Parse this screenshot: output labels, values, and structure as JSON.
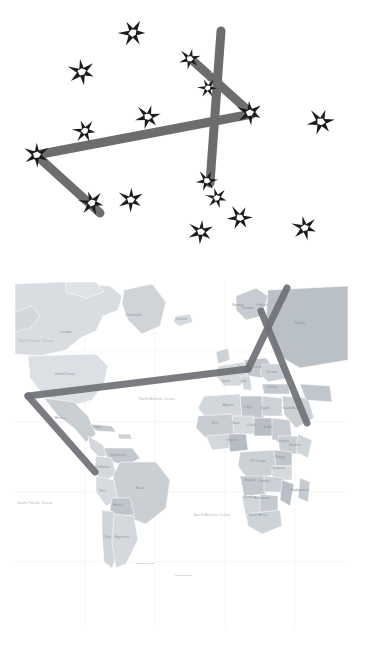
{
  "figure": {
    "panels": [
      {
        "id": "constellation",
        "name": "Hand-drawn constellation sketch"
      },
      {
        "id": "worldmap",
        "name": "World map with constellation overlay"
      }
    ]
  },
  "colors": {
    "background": "#ffffff",
    "line_stroke": "#6d6d6d",
    "line_stroke_map": "#6f7276",
    "star_fill": "#1c1c1c",
    "map_ocean": "#ffffff",
    "map_land_light": "#dfe3e6",
    "map_land_mid": "#c8cdd2",
    "map_land_dark": "#b0b7bd",
    "map_border": "#ffffff",
    "graticule": "#eceef0",
    "label_text": "#8d9398"
  },
  "constellation": {
    "name": "constellation-figure",
    "line_width": 9,
    "stroke_linecap": "round",
    "nodes": [
      {
        "id": "n-apex-top",
        "label": "apex-top",
        "x": 221,
        "y": 31
      },
      {
        "id": "n-vertex-mid",
        "label": "mid-junction",
        "x": 155,
        "y": 118
      },
      {
        "id": "n-right-end",
        "label": "right-terminus",
        "x": 252,
        "y": 114
      },
      {
        "id": "n-left-end",
        "label": "left-terminus",
        "x": 36,
        "y": 155
      },
      {
        "id": "n-bottom-left",
        "label": "bottom-left-tip",
        "x": 100,
        "y": 213
      },
      {
        "id": "n-bottom-right",
        "label": "bottom-right-tip",
        "x": 210,
        "y": 183
      },
      {
        "id": "n-elbow",
        "label": "upper-elbow",
        "x": 192,
        "y": 60
      }
    ],
    "segments": [
      {
        "id": "s1",
        "from": "n-apex-top",
        "to": "n-bottom-right",
        "label": "apex-to-bottom-right"
      },
      {
        "id": "s2",
        "from": "n-elbow",
        "to": "n-right-end",
        "label": "elbow-to-right"
      },
      {
        "id": "s3",
        "from": "n-left-end",
        "to": "n-right-end",
        "label": "long-horizontal-spine"
      },
      {
        "id": "s4",
        "from": "n-left-end",
        "to": "n-bottom-left",
        "label": "left-to-bottom-left"
      }
    ],
    "stars": [
      {
        "id": "st-1",
        "label": "star-top-left-outer",
        "x": 133,
        "y": 33,
        "r": 14,
        "on_line": false
      },
      {
        "id": "st-2",
        "label": "star-upper-left",
        "x": 82,
        "y": 72,
        "r": 14,
        "on_line": false
      },
      {
        "id": "st-3",
        "label": "star-apex",
        "x": 190,
        "y": 59,
        "r": 11,
        "on_line": true
      },
      {
        "id": "st-4",
        "label": "star-inner-triangle",
        "x": 208,
        "y": 88,
        "r": 10,
        "on_line": true
      },
      {
        "id": "st-5",
        "label": "star-right-terminus",
        "x": 250,
        "y": 113,
        "r": 13,
        "on_line": true
      },
      {
        "id": "st-6",
        "label": "star-mid-junction",
        "x": 148,
        "y": 117,
        "r": 13,
        "on_line": true
      },
      {
        "id": "st-7",
        "label": "star-left-spine",
        "x": 85,
        "y": 131,
        "r": 12,
        "on_line": true
      },
      {
        "id": "st-8",
        "label": "star-left-terminus",
        "x": 37,
        "y": 155,
        "r": 13,
        "on_line": true
      },
      {
        "id": "st-9",
        "label": "star-far-right",
        "x": 321,
        "y": 122,
        "r": 14,
        "on_line": false
      },
      {
        "id": "st-10",
        "label": "star-bottom-left-tip",
        "x": 92,
        "y": 203,
        "r": 13,
        "on_line": true
      },
      {
        "id": "st-11",
        "label": "star-below-spine",
        "x": 131,
        "y": 200,
        "r": 13,
        "on_line": false
      },
      {
        "id": "st-12",
        "label": "star-bottom-right-tip",
        "x": 207,
        "y": 181,
        "r": 11,
        "on_line": true
      },
      {
        "id": "st-13",
        "label": "star-lower-mid",
        "x": 217,
        "y": 198,
        "r": 11,
        "on_line": false
      },
      {
        "id": "st-14",
        "label": "star-lower-centre",
        "x": 201,
        "y": 232,
        "r": 13,
        "on_line": false
      },
      {
        "id": "st-15",
        "label": "star-lower-right",
        "x": 240,
        "y": 218,
        "r": 13,
        "on_line": false
      },
      {
        "id": "st-16",
        "label": "star-bottom-right-outer",
        "x": 305,
        "y": 228,
        "r": 13,
        "on_line": false
      }
    ]
  },
  "worldmap": {
    "name": "world-map",
    "projection": "equirectangular",
    "visible_region": "Americas, Atlantic Ocean, Europe, Africa",
    "frame": {
      "x": 15,
      "y": 6,
      "width": 333,
      "height": 346
    },
    "overlay": {
      "line_width": 7,
      "nodes": [
        {
          "id": "m-apex-top",
          "label": "apex-top",
          "x": 287,
          "y": 12
        },
        {
          "id": "m-elbow",
          "label": "upper-elbow",
          "x": 261,
          "y": 35
        },
        {
          "id": "m-vertex",
          "label": "mid-junction",
          "x": 248,
          "y": 93
        },
        {
          "id": "m-right-end",
          "label": "right-terminus",
          "x": 307,
          "y": 147
        },
        {
          "id": "m-left-end",
          "label": "left-terminus",
          "x": 28,
          "y": 120
        },
        {
          "id": "m-bottom-left",
          "label": "bottom-left-tip",
          "x": 95,
          "y": 196
        }
      ],
      "segments": [
        {
          "id": "ms1",
          "from": "m-apex-top",
          "to": "m-vertex",
          "label": "apex-to-junction"
        },
        {
          "id": "ms2",
          "from": "m-elbow",
          "to": "m-right-end",
          "label": "elbow-to-right"
        },
        {
          "id": "ms3",
          "from": "m-left-end",
          "to": "m-vertex",
          "label": "long-transatlantic-spine"
        },
        {
          "id": "ms4",
          "from": "m-left-end",
          "to": "m-bottom-left",
          "label": "left-to-bottom-left"
        }
      ]
    },
    "labels": {
      "oceans": [
        {
          "text": "North Atlantic Ocean",
          "x": 157,
          "y": 124
        },
        {
          "text": "South Atlantic Ocean",
          "x": 212,
          "y": 240
        },
        {
          "text": "North Pacific Ocean",
          "x": 36,
          "y": 66
        },
        {
          "text": "South Pacific Ocean",
          "x": 35,
          "y": 228
        }
      ],
      "regions": [
        {
          "text": "Greenland",
          "x": 133,
          "y": 40
        },
        {
          "text": "Canada",
          "x": 66,
          "y": 57
        },
        {
          "text": "Iceland",
          "x": 181,
          "y": 44
        },
        {
          "text": "United States",
          "x": 65,
          "y": 99
        },
        {
          "text": "Mexico",
          "x": 60,
          "y": 143
        },
        {
          "text": "Cuba",
          "x": 97,
          "y": 152
        },
        {
          "text": "Venezuela",
          "x": 118,
          "y": 180
        },
        {
          "text": "Colombia",
          "x": 103,
          "y": 192
        },
        {
          "text": "Brazil",
          "x": 140,
          "y": 213
        },
        {
          "text": "Peru",
          "x": 103,
          "y": 216
        },
        {
          "text": "Bolivia",
          "x": 118,
          "y": 230
        },
        {
          "text": "Chile",
          "x": 107,
          "y": 262
        },
        {
          "text": "Argentina",
          "x": 122,
          "y": 262
        },
        {
          "text": "Norway",
          "x": 238,
          "y": 30
        },
        {
          "text": "Sweden",
          "x": 248,
          "y": 33
        },
        {
          "text": "Finland",
          "x": 262,
          "y": 30
        },
        {
          "text": "Russia",
          "x": 300,
          "y": 48
        },
        {
          "text": "Spain",
          "x": 226,
          "y": 106
        },
        {
          "text": "France",
          "x": 232,
          "y": 97
        },
        {
          "text": "Germany",
          "x": 245,
          "y": 92
        },
        {
          "text": "Poland",
          "x": 256,
          "y": 92
        },
        {
          "text": "Ukraine",
          "x": 272,
          "y": 97
        },
        {
          "text": "Turkey",
          "x": 272,
          "y": 112
        },
        {
          "text": "Italy",
          "x": 243,
          "y": 106
        },
        {
          "text": "Algeria",
          "x": 228,
          "y": 130
        },
        {
          "text": "Libya",
          "x": 248,
          "y": 132
        },
        {
          "text": "Egypt",
          "x": 265,
          "y": 133
        },
        {
          "text": "Mali",
          "x": 215,
          "y": 148
        },
        {
          "text": "Niger",
          "x": 236,
          "y": 148
        },
        {
          "text": "Chad",
          "x": 251,
          "y": 150
        },
        {
          "text": "Sudan",
          "x": 268,
          "y": 152
        },
        {
          "text": "Nigeria",
          "x": 232,
          "y": 165
        },
        {
          "text": "Ethiopia",
          "x": 283,
          "y": 166
        },
        {
          "text": "Somalia",
          "x": 295,
          "y": 170
        },
        {
          "text": "Kenya",
          "x": 280,
          "y": 182
        },
        {
          "text": "DR Congo",
          "x": 258,
          "y": 186
        },
        {
          "text": "Angola",
          "x": 250,
          "y": 205
        },
        {
          "text": "Tanzania",
          "x": 278,
          "y": 193
        },
        {
          "text": "Zambia",
          "x": 264,
          "y": 206
        },
        {
          "text": "Namibia",
          "x": 250,
          "y": 222
        },
        {
          "text": "Botswana",
          "x": 262,
          "y": 223
        },
        {
          "text": "Madagascar",
          "x": 300,
          "y": 215
        },
        {
          "text": "South Africa",
          "x": 258,
          "y": 240
        },
        {
          "text": "Saudi Arabia",
          "x": 292,
          "y": 133
        }
      ],
      "notes": [
        {
          "text": "Falkland Islands",
          "x": 145,
          "y": 288
        },
        {
          "text": "South Georgia",
          "x": 183,
          "y": 300
        }
      ]
    }
  }
}
